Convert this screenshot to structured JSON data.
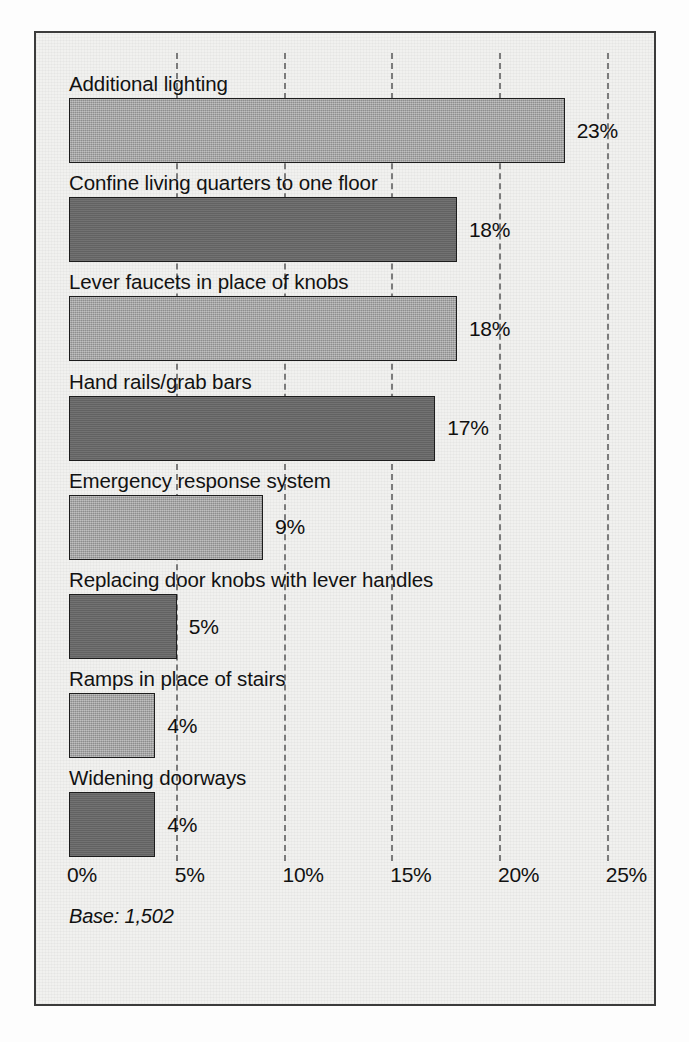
{
  "chart_data": {
    "type": "bar",
    "orientation": "horizontal",
    "title": "",
    "subtitle": "",
    "xlabel": "",
    "ylabel": "",
    "xlim": [
      0,
      27.5
    ],
    "grid": true,
    "legend": null,
    "categories": [
      "Additional lighting",
      "Confine living quarters to one floor",
      "Lever faucets in place of knobs",
      "Hand rails/grab bars",
      "Emergency response system",
      "Replacing door knobs with lever handles",
      "Ramps in place of stairs",
      "Widening doorways"
    ],
    "values": [
      23,
      18,
      18,
      17,
      9,
      5,
      4,
      4
    ],
    "value_labels": [
      "23%",
      "18%",
      "18%",
      "17%",
      "9%",
      "5%",
      "4%",
      "4%"
    ],
    "bar_shades": [
      "light",
      "dark",
      "light",
      "dark",
      "light",
      "dark",
      "light",
      "dark"
    ],
    "x_ticks": [
      0,
      5,
      10,
      15,
      20,
      25
    ],
    "x_tick_labels": [
      "0%",
      "5%",
      "10%",
      "15%",
      "20%",
      "25%"
    ],
    "annotations": [
      "Base: 1,502"
    ],
    "colors": {
      "bar_light": "#9b9b9b",
      "bar_dark": "#676767",
      "bar_outline": "#1d1d1d",
      "gridline": "#7b7b7b",
      "plate_background": "#f1f1ef",
      "frame_border": "#3b3b3b",
      "text": "#111111"
    }
  },
  "figure": {
    "base_note": "Base: 1,502"
  }
}
